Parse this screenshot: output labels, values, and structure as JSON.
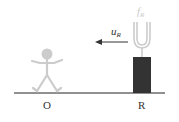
{
  "diagram": {
    "observer_label": "O",
    "source_label": "R",
    "velocity_label": {
      "symbol": "u",
      "subscript": "R"
    },
    "frequency_label": {
      "symbol": "f",
      "subscript": "R"
    },
    "colors": {
      "ground": "#222222",
      "box": "#333333",
      "figure": "#cccccc",
      "fork": "#cccccc",
      "arrow": "#333333"
    },
    "arrow_direction": "left"
  }
}
